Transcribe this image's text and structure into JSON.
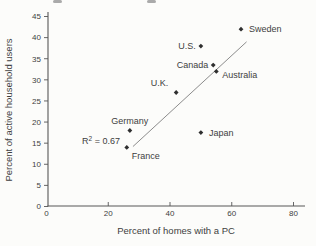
{
  "figure": {
    "background_color": "#fcfcfa",
    "text_color": "#3e3e3e",
    "axis_color": "#565656",
    "marker_color": "#2f2f2f",
    "trendline_color": "#8c8c8c"
  },
  "chart_data": {
    "type": "scatter",
    "title": "",
    "xlabel": "Percent of homes with a PC",
    "ylabel": "Percent of active household users",
    "xlim": [
      0,
      80
    ],
    "ylim": [
      0,
      45
    ],
    "xticks": [
      0,
      20,
      40,
      60,
      80
    ],
    "yticks": [
      0,
      5,
      10,
      15,
      20,
      25,
      30,
      35,
      40,
      45
    ],
    "grid": false,
    "legend": "none",
    "marker": "diamond",
    "points": [
      {
        "label": "Sweden",
        "x": 63,
        "y": 42,
        "label_side": "right"
      },
      {
        "label": "U.S.",
        "x": 50,
        "y": 38,
        "label_side": "left"
      },
      {
        "label": "Canada",
        "x": 54,
        "y": 33.5,
        "label_side": "left"
      },
      {
        "label": "Australia",
        "x": 55,
        "y": 32,
        "label_side": "right-below"
      },
      {
        "label": "U.K.",
        "x": 42,
        "y": 27,
        "label_side": "above-left"
      },
      {
        "label": "Germany",
        "x": 27,
        "y": 18,
        "label_side": "above"
      },
      {
        "label": "Japan",
        "x": 50,
        "y": 17.5,
        "label_side": "right"
      },
      {
        "label": "France",
        "x": 26,
        "y": 14,
        "label_side": "below-right"
      }
    ],
    "trendline": {
      "x1": 28,
      "y1": 14.2,
      "x2": 64.8,
      "y2": 39
    },
    "annotation": {
      "base": "R",
      "sup": "2",
      "rest": " = 0.67",
      "display": "R2 = 0.67",
      "x": 11.5,
      "y": 14.8
    },
    "r_squared": 0.67
  }
}
